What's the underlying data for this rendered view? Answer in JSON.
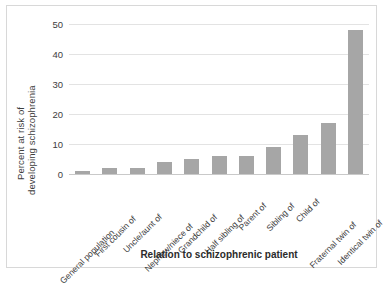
{
  "chart_data": {
    "type": "bar",
    "title": "",
    "xlabel": "Relation to schizophrenic patient",
    "ylabel_line1": "Percent at risk of",
    "ylabel_line2": "developing schizophrenia",
    "categories": [
      "General population",
      "First cousin of",
      "Uncle/aunt of",
      "Nephew/niece of",
      "Grandchild of",
      "Half sibling of",
      "Parent of",
      "Sibling of",
      "Child of",
      "Fraternal twin of",
      "Identical twin of"
    ],
    "values": [
      1,
      2,
      2,
      4,
      5,
      6,
      6,
      9,
      13,
      17,
      48
    ],
    "ylim": [
      0,
      50
    ],
    "yticks": [
      0,
      10,
      20,
      30,
      40,
      50
    ],
    "ytick_labels": [
      "0",
      "10",
      "20",
      "30",
      "40",
      "50"
    ],
    "grid": true,
    "legend": "none",
    "bar_color": "#a6a6a6",
    "gridline_color": "#e3e3e3",
    "axis_color": "#c9c9c9",
    "text_color": "#3d3d3d",
    "background": "#ffffff",
    "border_color": "#d8d8d8"
  }
}
